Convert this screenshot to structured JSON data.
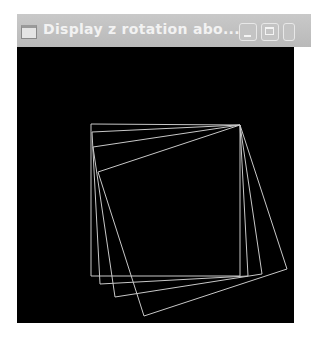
{
  "window": {
    "title": "Display z rotation abo...",
    "icons": {
      "app": "window-icon",
      "minimize": "minimize-icon",
      "maximize": "maximize-icon",
      "close": "close-icon"
    }
  },
  "canvas": {
    "background": "#000000",
    "line_color": "#c8c8c8",
    "pivot": [
      223,
      78
    ],
    "squares": [
      {
        "angle_deg": 0,
        "points": "74,77 223,78 223,229 74,229"
      },
      {
        "angle_deg": 3,
        "points": "75,85 223,78 231,229 83,237"
      },
      {
        "angle_deg": 8.5,
        "points": "76,100 223,78 245,227 98,250"
      },
      {
        "angle_deg": 18,
        "points": "81,125 223,78 270,222 127,269"
      }
    ]
  }
}
